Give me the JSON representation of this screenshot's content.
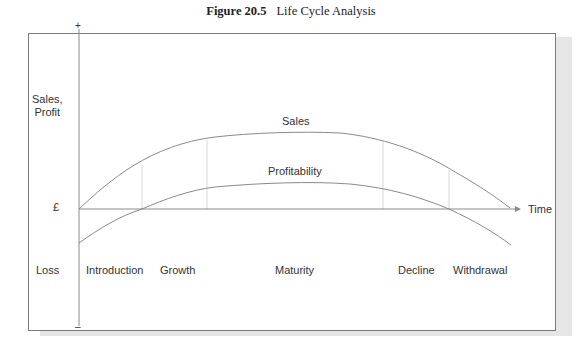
{
  "figure": {
    "number": "Figure 20.5",
    "title": "Life Cycle Analysis"
  },
  "axes": {
    "y_label_line1": "Sales,",
    "y_label_line2": "Profit",
    "y_plus": "+",
    "y_minus": "–",
    "currency": "£",
    "loss": "Loss",
    "x_label": "Time"
  },
  "curves": {
    "sales_label": "Sales",
    "profit_label": "Profitability"
  },
  "stages": [
    {
      "label": "Introduction"
    },
    {
      "label": "Growth"
    },
    {
      "label": "Maturity"
    },
    {
      "label": "Decline"
    },
    {
      "label": "Withdrawal"
    }
  ],
  "colors": {
    "line": "#8a8a8a",
    "divider": "#d8d8d8",
    "frame": "#7a7a7a",
    "text": "#333333"
  }
}
